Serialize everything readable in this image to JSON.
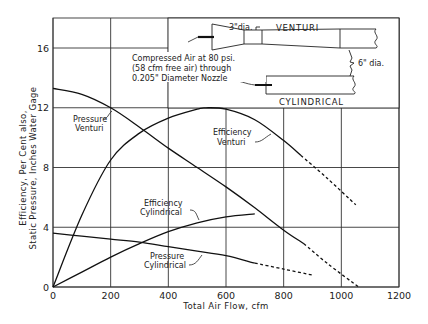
{
  "chart_data": {
    "type": "line",
    "title": "",
    "xlabel": "Total Air Flow, cfm",
    "ylabel_line1": "Efficiency, Per Cent also,",
    "ylabel_line2": "Static Pressure, Inches Water Gage",
    "xlim": [
      0,
      1200
    ],
    "ylim": [
      0,
      18
    ],
    "grid": true,
    "x_ticks": [
      "0",
      "200",
      "400",
      "600",
      "800",
      "1000",
      "1200"
    ],
    "y_ticks": [
      "0",
      "4",
      "8",
      "12",
      "16"
    ],
    "series": [
      {
        "name": "Pressure Venturi",
        "label_line1": "Pressure",
        "label_line2": "Venturi",
        "x": [
          0,
          100,
          200,
          300,
          400,
          500,
          600,
          700,
          800,
          870
        ],
        "values": [
          13.3,
          12.9,
          12.0,
          10.7,
          9.3,
          8.0,
          6.7,
          5.3,
          3.8,
          2.9
        ],
        "dashed_x": [
          870,
          950,
          1060
        ],
        "dashed_values": [
          2.9,
          1.6,
          0
        ]
      },
      {
        "name": "Efficiency Venturi",
        "label_line1": "Efficiency",
        "label_line2": "Venturi",
        "x": [
          0,
          100,
          200,
          300,
          400,
          500,
          530,
          600,
          700,
          800,
          860
        ],
        "values": [
          0,
          4.8,
          8.5,
          10.3,
          11.3,
          11.9,
          12.0,
          11.9,
          11.2,
          9.8,
          8.8
        ],
        "dashed_x": [
          860,
          950,
          1050
        ],
        "dashed_values": [
          8.8,
          7.3,
          5.5
        ]
      },
      {
        "name": "Efficiency Cylindrical",
        "label_line1": "Efficiency",
        "label_line2": "Cylindrical",
        "x": [
          0,
          100,
          200,
          300,
          400,
          500,
          600,
          700
        ],
        "values": [
          0,
          1.0,
          2.0,
          2.9,
          3.7,
          4.3,
          4.7,
          4.9
        ],
        "dashed_x": [],
        "dashed_values": []
      },
      {
        "name": "Pressure Cylindrical",
        "label_line1": "Pressure",
        "label_line2": "Cylindrical",
        "x": [
          0,
          100,
          200,
          300,
          400,
          500,
          600,
          700
        ],
        "values": [
          3.6,
          3.4,
          3.2,
          3.0,
          2.7,
          2.4,
          2.1,
          1.6
        ],
        "dashed_x": [
          700,
          800,
          900
        ],
        "dashed_values": [
          1.6,
          1.2,
          0.8
        ]
      }
    ],
    "inset": {
      "venturi_label": "VENTURI",
      "cylindrical_label": "CYLINDRICAL",
      "throat_label": "3\"dia.",
      "pipe_label": "6\" dia.",
      "note_line1": "Compressed Air at 80 psi.",
      "note_line2": "(58 cfm free air) through",
      "note_line3": "0.205\" Diameter Nozzle"
    }
  }
}
